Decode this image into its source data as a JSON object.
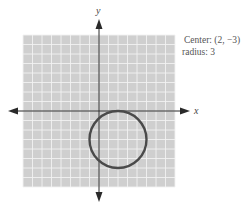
{
  "figure": {
    "type": "coordinate-plane-circle",
    "x_axis_label": "x",
    "y_axis_label": "y",
    "grid": {
      "x_min": -8,
      "x_max": 8,
      "y_min": -8,
      "y_max": 8,
      "step": 1
    },
    "circle": {
      "center_x": 2,
      "center_y": -3,
      "radius": 3
    },
    "colors": {
      "grid_background": "#cfcfcf",
      "grid_lines": "#f2f2f2",
      "axes": "#2a2a2a",
      "circle": "#4a4a4a",
      "text": "#555555"
    }
  },
  "caption": {
    "center_text": "Center: (2, −3)",
    "radius_text": "radius: 3"
  }
}
